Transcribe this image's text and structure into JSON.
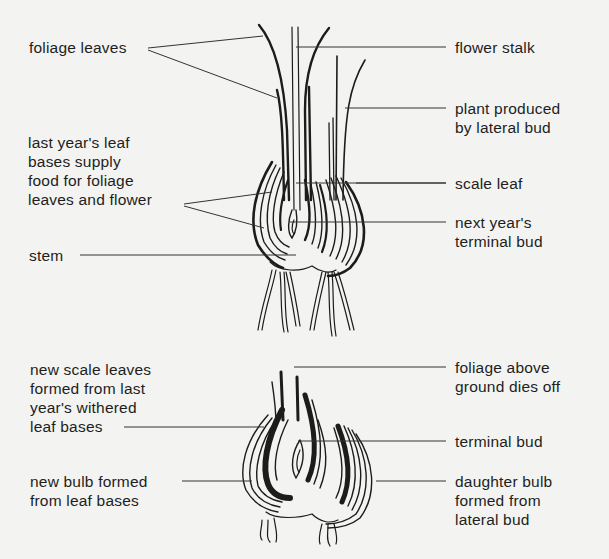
{
  "diagram": {
    "figures": [
      {
        "id": "top",
        "description": "Growing onion plant in spring / summer",
        "labels": {
          "foliage_leaves": "foliage leaves",
          "flower_stalk": "flower stalk",
          "plant_lateral_bud": "plant produced\nby lateral bud",
          "last_years_leaf_bases": "last year's leaf\nbases supply\nfood for foliage\nleaves and flower",
          "scale_leaf": "scale leaf",
          "next_years_terminal_bud": "next year's\nterminal bud",
          "stem": "stem"
        }
      },
      {
        "id": "bottom",
        "description": "Dormant onion bulb at end of season",
        "labels": {
          "new_scale_leaves": "new scale leaves\nformed from last\nyear's withered\nleaf bases",
          "foliage_dies_off": "foliage above\nground dies off",
          "terminal_bud": "terminal bud",
          "new_bulb": "new bulb formed\nfrom leaf bases",
          "daughter_bulb": "daughter bulb\nformed from\nlateral bud"
        }
      }
    ],
    "colors": {
      "background": "#f3f3f1",
      "ink": "#1c1c1c",
      "leader_line": "#333333",
      "bleed_through": "#d9d9d6"
    }
  }
}
